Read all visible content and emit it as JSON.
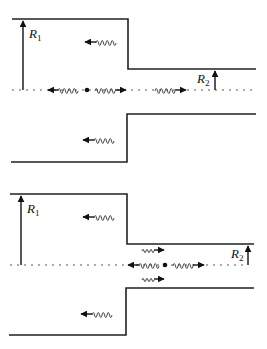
{
  "figure": {
    "panels": [
      {
        "name": "top",
        "labels": {
          "r1": "R",
          "r1_sub": "1",
          "r2": "R",
          "r2_sub": "2"
        },
        "waves": [
          {
            "pos": "wide-upper",
            "direction": "left"
          },
          {
            "pos": "axis-left-of-source",
            "direction": "left"
          },
          {
            "pos": "axis-right-of-source",
            "direction": "right"
          },
          {
            "pos": "narrow-axis",
            "direction": "right"
          },
          {
            "pos": "wide-lower",
            "direction": "left"
          }
        ],
        "source": "point-source-in-wide-section"
      },
      {
        "name": "bottom",
        "labels": {
          "r1": "R",
          "r1_sub": "1",
          "r2": "R",
          "r2_sub": "2"
        },
        "waves": [
          {
            "pos": "wide-upper",
            "direction": "left"
          },
          {
            "pos": "narrow-upper",
            "direction": "right"
          },
          {
            "pos": "axis-left-of-source",
            "direction": "left"
          },
          {
            "pos": "axis-right-of-source",
            "direction": "right"
          },
          {
            "pos": "narrow-lower",
            "direction": "right"
          },
          {
            "pos": "wide-lower",
            "direction": "left"
          }
        ],
        "source": "point-source-in-narrow-section"
      }
    ],
    "colors": {
      "line": "#222222",
      "background": "#ffffff"
    }
  }
}
